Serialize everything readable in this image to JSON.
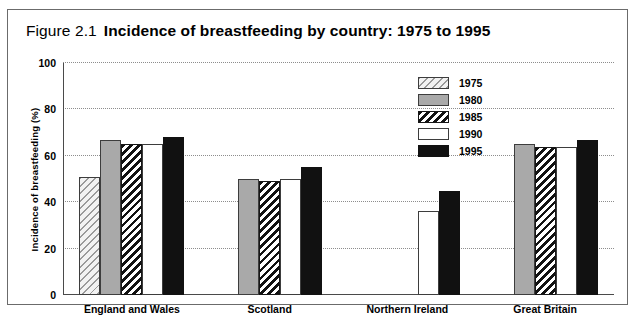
{
  "figure": {
    "number": "Figure 2.1",
    "title": "Incidence of breastfeeding by country: 1975 to 1995"
  },
  "chart_data": {
    "type": "bar",
    "title": "Incidence of breastfeeding by country: 1975 to 1995",
    "xlabel": "",
    "ylabel": "Incidence of breastfeeding (%)",
    "ylim": [
      0,
      100
    ],
    "yticks": [
      0,
      20,
      40,
      60,
      80,
      100
    ],
    "grid": true,
    "legend_position": "upper right",
    "categories": [
      "England and Wales",
      "Scotland",
      "Northern Ireland",
      "Great Britain"
    ],
    "series": [
      {
        "name": "1975",
        "color": "#f2f2f2",
        "pattern": "light-diagonal-hatch",
        "values": [
          51,
          null,
          null,
          null
        ]
      },
      {
        "name": "1980",
        "color": "#a9a9a9",
        "pattern": "solid-gray",
        "values": [
          67,
          50,
          null,
          65
        ]
      },
      {
        "name": "1985",
        "color": "#ffffff",
        "pattern": "dark-diagonal-hatch",
        "values": [
          65,
          49,
          null,
          64
        ]
      },
      {
        "name": "1990",
        "color": "#ffffff",
        "pattern": "solid-white",
        "values": [
          65,
          50,
          36,
          64
        ]
      },
      {
        "name": "1995",
        "color": "#111111",
        "pattern": "solid-black",
        "values": [
          68,
          55,
          45,
          67
        ]
      }
    ]
  }
}
